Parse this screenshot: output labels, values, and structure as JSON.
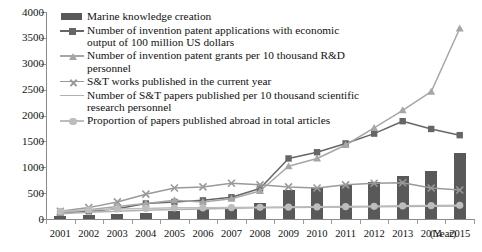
{
  "chart_data": {
    "type": "bar",
    "title": "",
    "xlabel": "(Year)",
    "ylabel": "",
    "ylim": [
      0,
      4000
    ],
    "ytick_step": 500,
    "yticks": [
      "4000",
      "3500",
      "3000",
      "2500",
      "2000",
      "1500",
      "1000",
      "500",
      "0"
    ],
    "grid": false,
    "legend_position": "top-left-inside",
    "categories": [
      "2001",
      "2002",
      "2003",
      "2004",
      "2005",
      "2006",
      "2007",
      "2008",
      "2009",
      "2010",
      "2011",
      "2012",
      "2013",
      "2014",
      "2015"
    ],
    "series": [
      {
        "name": "Marine knowledge creation",
        "type": "bar",
        "marker": "block",
        "color": "#595959",
        "values": [
          60,
          75,
          95,
          120,
          150,
          185,
          230,
          300,
          560,
          600,
          660,
          720,
          840,
          930,
          1270
        ]
      },
      {
        "name": "Number of invention patent applications with economic output of 100 million US dollars",
        "type": "line",
        "marker": "square",
        "color": "#666666",
        "values": [
          120,
          150,
          200,
          300,
          330,
          360,
          420,
          590,
          1170,
          1290,
          1460,
          1650,
          1890,
          1740,
          1620
        ]
      },
      {
        "name": "Number of invention patent grants per 10 thousand R&D personnel",
        "type": "line",
        "marker": "triangle",
        "color": "#a6a6a6",
        "values": [
          120,
          180,
          240,
          300,
          360,
          330,
          390,
          540,
          1020,
          1170,
          1430,
          1760,
          2100,
          2460,
          3680
        ]
      },
      {
        "name": "S&T works published in the current year",
        "type": "line",
        "marker": "cross",
        "color": "#9a9a9a",
        "values": [
          150,
          220,
          330,
          480,
          600,
          620,
          690,
          660,
          620,
          600,
          660,
          690,
          700,
          600,
          560
        ]
      },
      {
        "name": "Number of S&T papers published per 10 thousand scientific research personnel",
        "type": "line",
        "marker": "line",
        "color": "#b0b0b0",
        "values": [
          100,
          130,
          150,
          170,
          185,
          195,
          210,
          215,
          220,
          225,
          230,
          235,
          240,
          245,
          250
        ]
      },
      {
        "name": "Proportion of papers published abroad in total articles",
        "type": "line",
        "marker": "circle",
        "color": "#bdbdbd",
        "values": [
          150,
          175,
          195,
          205,
          215,
          215,
          220,
          225,
          230,
          235,
          240,
          245,
          255,
          260,
          265
        ]
      }
    ]
  }
}
